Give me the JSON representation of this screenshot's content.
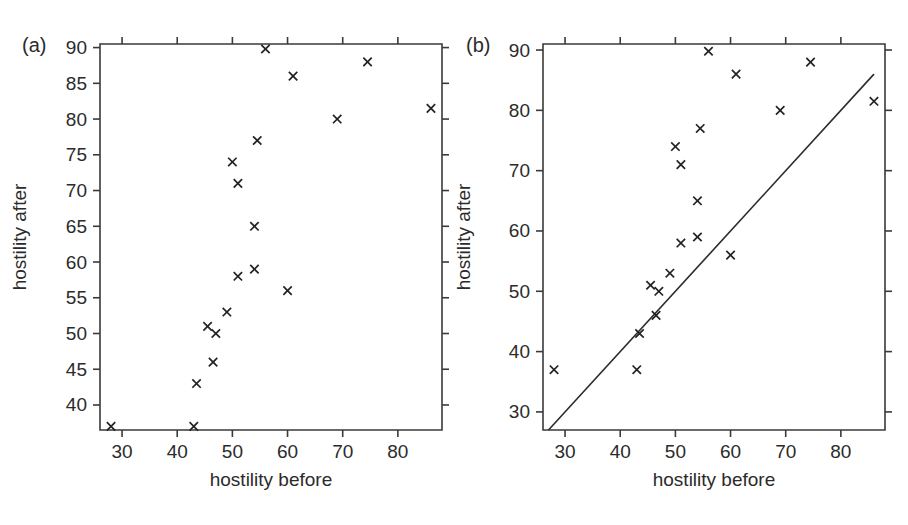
{
  "figure": {
    "background": "#ffffff",
    "ink_color": "#2b2b2b",
    "marker_symbol": "x"
  },
  "panels": {
    "a": {
      "letter": "(a)",
      "xlabel": "hostility before",
      "ylabel": "hostility after",
      "reference_line": false
    },
    "b": {
      "letter": "(b)",
      "xlabel": "hostility before",
      "ylabel": "hostility after",
      "reference_line": true,
      "reference_line_label": "y = x"
    }
  },
  "chart_data": [
    {
      "type": "scatter",
      "panel": "(a)",
      "title": "",
      "xlabel": "hostility before",
      "ylabel": "hostility after",
      "xlim": [
        26,
        88
      ],
      "ylim": [
        36.5,
        90.5
      ],
      "xticks": [
        30,
        40,
        50,
        60,
        70,
        80
      ],
      "yticks": [
        40,
        45,
        50,
        55,
        60,
        65,
        70,
        75,
        80,
        85,
        90
      ],
      "xticklabels": [
        "30",
        "40",
        "50",
        "60",
        "70",
        "80"
      ],
      "yticklabels": [
        "40",
        "45",
        "50",
        "55",
        "60",
        "65",
        "70",
        "75",
        "80",
        "85",
        "90"
      ],
      "grid": false,
      "legend": false,
      "marker": "x",
      "points": [
        {
          "x": 28,
          "y": 37
        },
        {
          "x": 43,
          "y": 37
        },
        {
          "x": 43.5,
          "y": 43
        },
        {
          "x": 46.5,
          "y": 46
        },
        {
          "x": 45.5,
          "y": 51
        },
        {
          "x": 47,
          "y": 50
        },
        {
          "x": 49,
          "y": 53
        },
        {
          "x": 51,
          "y": 58
        },
        {
          "x": 54,
          "y": 59
        },
        {
          "x": 50,
          "y": 74
        },
        {
          "x": 51,
          "y": 71
        },
        {
          "x": 54.5,
          "y": 77
        },
        {
          "x": 54,
          "y": 65
        },
        {
          "x": 60,
          "y": 56
        },
        {
          "x": 56,
          "y": 89.8
        },
        {
          "x": 61,
          "y": 86
        },
        {
          "x": 69,
          "y": 80
        },
        {
          "x": 74.5,
          "y": 88
        },
        {
          "x": 86,
          "y": 81.5
        }
      ]
    },
    {
      "type": "scatter",
      "panel": "(b)",
      "title": "",
      "xlabel": "hostility before",
      "ylabel": "hostility after",
      "xlim": [
        26,
        88
      ],
      "ylim": [
        27,
        91
      ],
      "xticks": [
        30,
        40,
        50,
        60,
        70,
        80
      ],
      "yticks": [
        30,
        40,
        50,
        60,
        70,
        80,
        90
      ],
      "xticklabels": [
        "30",
        "40",
        "50",
        "60",
        "70",
        "80"
      ],
      "yticklabels": [
        "30",
        "40",
        "50",
        "60",
        "70",
        "80",
        "90"
      ],
      "grid": false,
      "legend": false,
      "marker": "x",
      "reference_line": {
        "type": "identity",
        "from": [
          27,
          27
        ],
        "to": [
          86,
          86
        ]
      },
      "points": [
        {
          "x": 28,
          "y": 37
        },
        {
          "x": 43,
          "y": 37
        },
        {
          "x": 43.5,
          "y": 43
        },
        {
          "x": 46.5,
          "y": 46
        },
        {
          "x": 45.5,
          "y": 51
        },
        {
          "x": 47,
          "y": 50
        },
        {
          "x": 49,
          "y": 53
        },
        {
          "x": 51,
          "y": 58
        },
        {
          "x": 54,
          "y": 59
        },
        {
          "x": 50,
          "y": 74
        },
        {
          "x": 51,
          "y": 71
        },
        {
          "x": 54.5,
          "y": 77
        },
        {
          "x": 54,
          "y": 65
        },
        {
          "x": 60,
          "y": 56
        },
        {
          "x": 56,
          "y": 89.8
        },
        {
          "x": 61,
          "y": 86
        },
        {
          "x": 69,
          "y": 80
        },
        {
          "x": 74.5,
          "y": 88
        },
        {
          "x": 86,
          "y": 81.5
        }
      ]
    }
  ]
}
